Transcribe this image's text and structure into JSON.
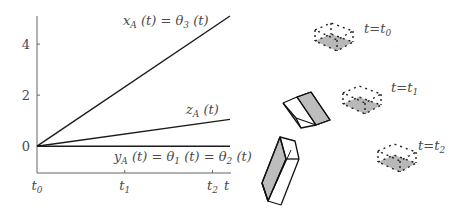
{
  "chart_data": {
    "type": "line",
    "title": "",
    "xlabel": "t",
    "ylabel": "",
    "x_ticks": [
      {
        "value": 0,
        "label": "t0"
      },
      {
        "value": 1,
        "label": "t1"
      },
      {
        "value": 2,
        "label": "t2"
      }
    ],
    "y_ticks": [
      0,
      2,
      4
    ],
    "xlim": [
      0,
      2.2
    ],
    "ylim": [
      -1.05,
      5.1
    ],
    "grid": false,
    "series": [
      {
        "name": "x_A(t) = θ3(t)",
        "x": [
          0,
          2.2
        ],
        "y": [
          0,
          5.1
        ]
      },
      {
        "name": "z_A(t)",
        "x": [
          0,
          2.2
        ],
        "y": [
          0,
          1.05
        ]
      },
      {
        "name": "y_A(t) = θ1(t) = θ2(t)",
        "x": [
          0,
          2.2
        ],
        "y": [
          0,
          0
        ]
      }
    ],
    "annotations": {
      "xA": {
        "main": "x",
        "sub": "A",
        "rest": " (t) = θ",
        "sub2": "3",
        "end": " (t)"
      },
      "zA": {
        "main": "z",
        "sub": "A",
        "rest": " (t)"
      },
      "yA": {
        "main": "y",
        "sub": "A",
        "rest": " (t) = θ",
        "sub2": "1",
        "mid": " (t) = θ",
        "sub3": "2",
        "end": " (t)"
      }
    }
  },
  "diagram": {
    "time_labels": [
      {
        "t": "t",
        "eq": "=",
        "sym": "t",
        "sub": "0"
      },
      {
        "t": "t",
        "eq": "=",
        "sym": "t",
        "sub": "1"
      },
      {
        "t": "t",
        "eq": "=",
        "sym": "t",
        "sub": "2"
      }
    ],
    "colors": {
      "line": "#1a1a1a",
      "shade": "#b8b8b8",
      "axis": "#555555",
      "text": "#4a4a4a"
    }
  }
}
